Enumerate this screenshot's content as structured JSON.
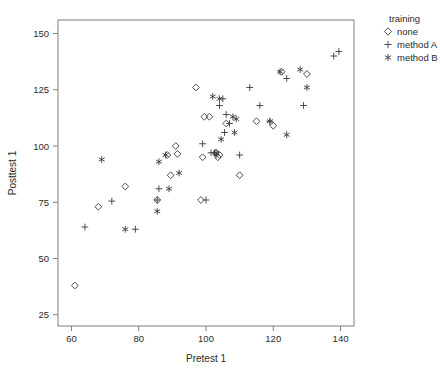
{
  "chart_data": {
    "type": "scatter",
    "title": "",
    "xlabel": "Pretest 1",
    "ylabel": "Posttest 1",
    "xlim": [
      56,
      144
    ],
    "ylim": [
      20,
      156
    ],
    "xticks": [
      60,
      80,
      100,
      120,
      140
    ],
    "yticks": [
      25,
      50,
      75,
      100,
      125,
      150
    ],
    "grid": false,
    "legend_position": "right",
    "legend_title": "training",
    "series": [
      {
        "name": "none",
        "marker": "diamond",
        "points": [
          [
            61,
            38
          ],
          [
            68,
            73
          ],
          [
            76,
            82
          ],
          [
            85.5,
            76
          ],
          [
            88.5,
            96
          ],
          [
            89.5,
            87
          ],
          [
            91,
            100
          ],
          [
            91.5,
            96.5
          ],
          [
            97,
            126
          ],
          [
            98.5,
            76
          ],
          [
            99,
            95
          ],
          [
            99.5,
            113
          ],
          [
            101,
            113
          ],
          [
            103,
            97
          ],
          [
            103.5,
            95
          ],
          [
            104,
            96
          ],
          [
            106,
            110
          ],
          [
            110,
            87
          ],
          [
            115,
            111
          ],
          [
            120,
            109
          ],
          [
            122.5,
            133
          ],
          [
            130,
            132
          ]
        ]
      },
      {
        "name": "method A",
        "marker": "plus",
        "points": [
          [
            64,
            64
          ],
          [
            72,
            75.5
          ],
          [
            79,
            63
          ],
          [
            86,
            81
          ],
          [
            85.5,
            76
          ],
          [
            99,
            101
          ],
          [
            100,
            76
          ],
          [
            101.5,
            97
          ],
          [
            102.5,
            97
          ],
          [
            103,
            96
          ],
          [
            104,
            118
          ],
          [
            105,
            121
          ],
          [
            106,
            114
          ],
          [
            107,
            110
          ],
          [
            110,
            96
          ],
          [
            105.5,
            106
          ],
          [
            113,
            126
          ],
          [
            116,
            118
          ],
          [
            119,
            111
          ],
          [
            124,
            130
          ],
          [
            129,
            118
          ],
          [
            138,
            140
          ],
          [
            139.5,
            142
          ]
        ]
      },
      {
        "name": "method B",
        "marker": "star",
        "points": [
          [
            69,
            94
          ],
          [
            76,
            63
          ],
          [
            85.5,
            71
          ],
          [
            86,
            93
          ],
          [
            88,
            96
          ],
          [
            89,
            81
          ],
          [
            92,
            88
          ],
          [
            102,
            122
          ],
          [
            104,
            121
          ],
          [
            104.5,
            103
          ],
          [
            103,
            97
          ],
          [
            108,
            113
          ],
          [
            109,
            112
          ],
          [
            108.5,
            106
          ],
          [
            119,
            111
          ],
          [
            122,
            133
          ],
          [
            124,
            105
          ],
          [
            128,
            134
          ],
          [
            130,
            126
          ]
        ]
      }
    ]
  },
  "axes": {
    "x_title": "Pretest 1",
    "y_title": "Posttest 1"
  }
}
